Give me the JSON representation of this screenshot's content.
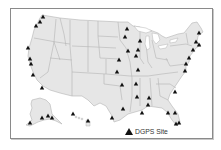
{
  "map": {
    "title": "DGPS Sites",
    "land_color": "#e6e6e6",
    "border_color": "#b4b4b4",
    "marker_color": "#111111",
    "regions": [
      "Contiguous United States",
      "Alaska",
      "Hawaii"
    ]
  },
  "legend": {
    "icon": "triangle-marker-icon",
    "label": "DGPS Site"
  },
  "sites": [
    {
      "region": "Washington",
      "x": 43,
      "y": 17
    },
    {
      "region": "Washington",
      "x": 40,
      "y": 22
    },
    {
      "region": "Washington",
      "x": 36,
      "y": 26
    },
    {
      "region": "Oregon",
      "x": 28,
      "y": 48
    },
    {
      "region": "California",
      "x": 30,
      "y": 59
    },
    {
      "region": "California",
      "x": 31,
      "y": 64
    },
    {
      "region": "California",
      "x": 33,
      "y": 75
    },
    {
      "region": "California",
      "x": 42,
      "y": 88
    },
    {
      "region": "Minnesota",
      "x": 127,
      "y": 29
    },
    {
      "region": "Minnesota",
      "x": 125,
      "y": 37
    },
    {
      "region": "Wisconsin",
      "x": 140,
      "y": 41
    },
    {
      "region": "Wisconsin",
      "x": 138,
      "y": 50
    },
    {
      "region": "Iowa",
      "x": 128,
      "y": 51
    },
    {
      "region": "Illinois",
      "x": 136,
      "y": 56
    },
    {
      "region": "Missouri",
      "x": 119,
      "y": 60
    },
    {
      "region": "Kansas",
      "x": 117,
      "y": 72
    },
    {
      "region": "Illinois",
      "x": 138,
      "y": 70
    },
    {
      "region": "Maine",
      "x": 199,
      "y": 33
    },
    {
      "region": "Massachusetts",
      "x": 196,
      "y": 42
    },
    {
      "region": "Massachusetts",
      "x": 199,
      "y": 45
    },
    {
      "region": "New Jersey",
      "x": 193,
      "y": 50
    },
    {
      "region": "Virginia",
      "x": 189,
      "y": 58
    },
    {
      "region": "Virginia",
      "x": 186,
      "y": 64
    },
    {
      "region": "North Carolina",
      "x": 185,
      "y": 71
    },
    {
      "region": "Oklahoma",
      "x": 122,
      "y": 85
    },
    {
      "region": "Arkansas",
      "x": 136,
      "y": 84
    },
    {
      "region": "Mississippi",
      "x": 137,
      "y": 97
    },
    {
      "region": "Alabama",
      "x": 149,
      "y": 98
    },
    {
      "region": "Alabama",
      "x": 148,
      "y": 105
    },
    {
      "region": "South Carolina",
      "x": 175,
      "y": 92
    },
    {
      "region": "Texas",
      "x": 123,
      "y": 109
    },
    {
      "region": "Texas",
      "x": 112,
      "y": 118
    },
    {
      "region": "Louisiana",
      "x": 142,
      "y": 113
    },
    {
      "region": "Florida",
      "x": 168,
      "y": 113
    },
    {
      "region": "Florida",
      "x": 175,
      "y": 113
    },
    {
      "region": "Florida",
      "x": 176,
      "y": 124
    },
    {
      "region": "Florida",
      "x": 179,
      "y": 123
    },
    {
      "region": "Alaska",
      "x": 30,
      "y": 123
    },
    {
      "region": "Alaska",
      "x": 42,
      "y": 118
    },
    {
      "region": "Alaska",
      "x": 48,
      "y": 116
    },
    {
      "region": "Alaska",
      "x": 52,
      "y": 118
    },
    {
      "region": "Hawaii",
      "x": 73,
      "y": 114
    },
    {
      "region": "Hawaii",
      "x": 88,
      "y": 121
    }
  ]
}
